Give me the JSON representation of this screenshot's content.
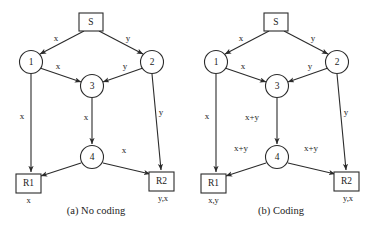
{
  "figure": {
    "background_color": "#ffffff",
    "stroke_color": "#2b2b2b",
    "text_color": "#1c1c1c"
  },
  "panels": [
    {
      "id": "no-coding",
      "caption": "(a) No coding",
      "origin_x": 0,
      "nodes": {
        "source": "S",
        "n1": "1",
        "n2": "2",
        "n3": "3",
        "n4": "4",
        "r1": "R1",
        "r2": "R2"
      },
      "edge_labels": {
        "s_to_1": "x",
        "s_to_2": "y",
        "n1_to_3": "x",
        "n2_to_3": "y",
        "n1_to_r1": "x",
        "n3_to_4": "x",
        "n2_to_r2": "y",
        "n4_to_r1": "",
        "n4_to_r2": "x"
      },
      "received": {
        "r1": "x",
        "r2": "y,x"
      }
    },
    {
      "id": "coding",
      "caption": "(b) Coding",
      "origin_x": 185,
      "nodes": {
        "source": "S",
        "n1": "1",
        "n2": "2",
        "n3": "3",
        "n4": "4",
        "r1": "R1",
        "r2": "R2"
      },
      "edge_labels": {
        "s_to_1": "x",
        "s_to_2": "y",
        "n1_to_3": "x",
        "n2_to_3": "y",
        "n1_to_r1": "x",
        "n3_to_4": "x+y",
        "n2_to_r2": "y",
        "n4_to_r1": "x+y",
        "n4_to_r2": "x+y"
      },
      "received": {
        "r1": "x,y",
        "r2": "y,x"
      }
    }
  ]
}
